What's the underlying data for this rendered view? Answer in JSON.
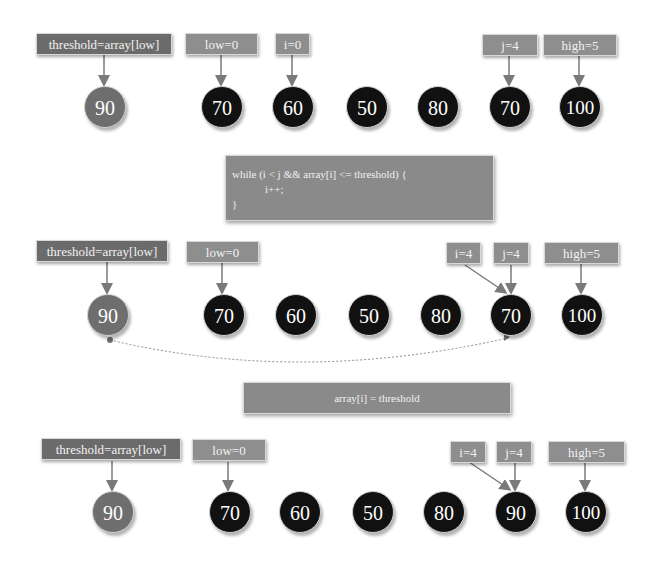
{
  "colors": {
    "pivot_node": "#6e6e6e",
    "normal_node": "#111111",
    "label_dark": "#6b6b6b",
    "label_light": "#8e8e8e",
    "code_box": "#8a8a8a",
    "arrow": "#7a7a7a"
  },
  "steps": [
    {
      "labels": {
        "threshold": "threshold=array[low]",
        "low": "low=0",
        "i": "i=0",
        "j": "j=4",
        "high": "high=5"
      },
      "array": [
        "90",
        "70",
        "60",
        "50",
        "80",
        "70",
        "100"
      ]
    },
    {
      "labels": {
        "threshold": "threshold=array[low]",
        "low": "low=0",
        "i": "i=4",
        "j": "j=4",
        "high": "high=5"
      },
      "array": [
        "90",
        "70",
        "60",
        "50",
        "80",
        "70",
        "100"
      ]
    },
    {
      "labels": {
        "threshold": "threshold=array[low]",
        "low": "low=0",
        "i": "i=4",
        "j": "j=4",
        "high": "high=5"
      },
      "array": [
        "90",
        "70",
        "60",
        "50",
        "80",
        "90",
        "100"
      ]
    }
  ],
  "code_while": {
    "line1": "while (i < j && array[i] <= threshold) {",
    "line2": "            i++;",
    "line3": "}"
  },
  "code_assign": "array[i] = threshold"
}
